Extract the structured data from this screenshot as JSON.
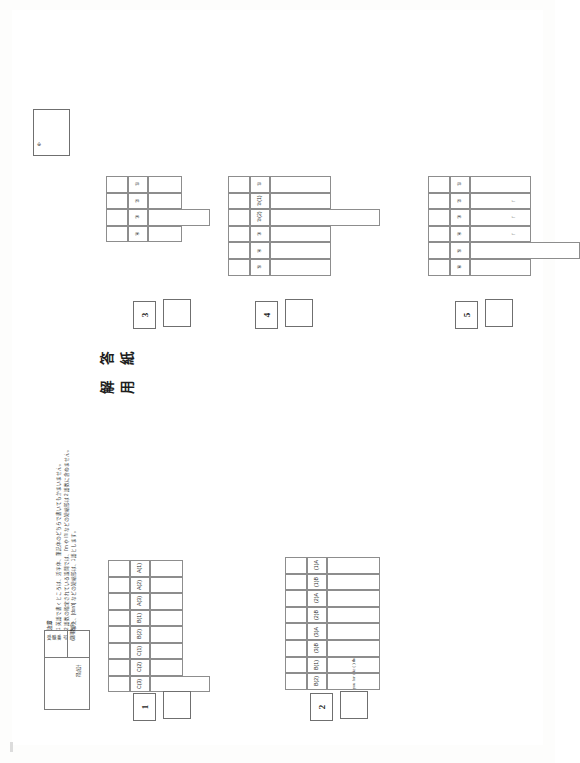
{
  "sheet": {
    "title": "解 答 用 紙",
    "mark_symbol": "※",
    "notes_heading": "注意",
    "notes": [
      "1  英語で書くところは、活字体、筆記体のどちらで書いてもかまいません。",
      "2  語数の指定されている設問では、I'm や I'll などの短縮形は 2 語数に含めません。",
      "また、[don't] などの短縮形は、1 語とします。"
    ],
    "score_box": {
      "exam_no_label": "受 験\n番 号",
      "exam_no_sub": "(算用数字)",
      "score_label": "得点計"
    }
  },
  "sections": [
    {
      "number": "1",
      "labels": [
        "A(1)",
        "A(2)",
        "A(3)",
        "B(1)",
        "B(2)",
        "C(1)",
        "C(2)",
        "C(3)"
      ],
      "answers": [
        "",
        "",
        "",
        "",
        "",
        "",
        "",
        ""
      ],
      "tall_cell_index": 7
    },
    {
      "number": "2",
      "labels": [
        "(1)A",
        "(1)B",
        "(2)A",
        "(2)B",
        "(3)A",
        "(3)B",
        "B(1)",
        "B(2)"
      ],
      "answers": [
        "",
        "",
        "",
        "",
        "",
        "",
        "",
        ""
      ],
      "prompts": [
        {
          "index": 6,
          "text": "I like (                              ) there."
        },
        {
          "index": 7,
          "text": "I (                              ) for you for one hour."
        }
      ]
    },
    {
      "number": "3",
      "labels": [
        "①",
        "②",
        "③",
        "④"
      ],
      "answers": [
        "",
        "",
        "",
        ""
      ],
      "tall_cell_index": 2
    },
    {
      "number": "4",
      "labels": [
        "①",
        "②(1)",
        "②(2)",
        "③",
        "④",
        "⑤"
      ],
      "answers": [
        "",
        "",
        "",
        "",
        "",
        ""
      ],
      "tall_cell_index": 2
    },
    {
      "number": "5",
      "labels": [
        "①",
        "②",
        "③",
        "④",
        "⑤",
        "⑥"
      ],
      "answers": [
        "",
        "",
        "",
        "",
        "",
        ""
      ],
      "tall_cell_index": 4,
      "arrow_rows": 3,
      "arrow_glyph": "↑"
    }
  ]
}
